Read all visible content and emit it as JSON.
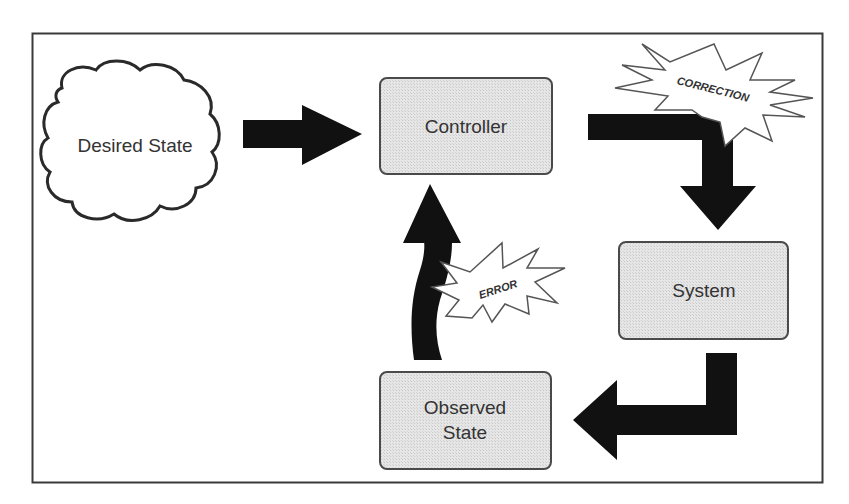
{
  "diagram": {
    "type": "feedback-control-loop",
    "nodes": {
      "desired_state": {
        "label": "Desired State",
        "shape": "cloud"
      },
      "controller": {
        "label": "Controller",
        "shape": "rounded-box"
      },
      "system": {
        "label": "System",
        "shape": "rounded-box"
      },
      "observed_state": {
        "label_line1": "Observed",
        "label_line2": "State",
        "shape": "rounded-box"
      }
    },
    "bursts": {
      "correction": {
        "label": "CORRECTION"
      },
      "error": {
        "label": "ERROR"
      }
    },
    "edges": [
      {
        "from": "Desired State",
        "to": "Controller"
      },
      {
        "from": "Controller",
        "to": "System",
        "annotation": "CORRECTION"
      },
      {
        "from": "System",
        "to": "Observed State"
      },
      {
        "from": "Observed State",
        "to": "Controller",
        "annotation": "ERROR"
      }
    ],
    "colors": {
      "frame": "#3a3a3a",
      "box_fill": "#e2e2e2",
      "box_stroke": "#4a4a4a",
      "arrow": "#111111",
      "text": "#333333"
    }
  }
}
